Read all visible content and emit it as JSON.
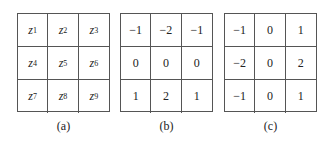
{
  "panels": [
    {
      "id": "a",
      "caption": "(a)",
      "cells": [
        {
          "var": "z",
          "sub": "1"
        },
        {
          "var": "z",
          "sub": "2"
        },
        {
          "var": "z",
          "sub": "3"
        },
        {
          "var": "z",
          "sub": "4"
        },
        {
          "var": "z",
          "sub": "5"
        },
        {
          "var": "z",
          "sub": "6"
        },
        {
          "var": "z",
          "sub": "7"
        },
        {
          "var": "z",
          "sub": "8"
        },
        {
          "var": "z",
          "sub": "9"
        }
      ]
    },
    {
      "id": "b",
      "caption": "(b)",
      "cells": [
        "−1",
        "−2",
        "−1",
        "0",
        "0",
        "0",
        "1",
        "2",
        "1"
      ]
    },
    {
      "id": "c",
      "caption": "(c)",
      "cells": [
        "−1",
        "0",
        "1",
        "−2",
        "0",
        "2",
        "−1",
        "0",
        "1"
      ]
    }
  ]
}
